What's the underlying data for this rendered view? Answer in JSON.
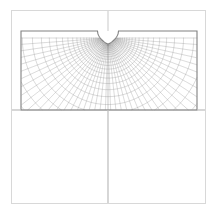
{
  "figure": {
    "title": "Polar finite-element mesh around a U-shaped edge notch",
    "caption": "",
    "background_color": "#ffffff",
    "width": 218,
    "height": 217
  },
  "outer_frame": {
    "name": "outer-frame",
    "x": 11,
    "y": 10,
    "width": 194,
    "height": 193,
    "stroke": "#d8d8d8",
    "stroke_width": 1,
    "fill": "none"
  },
  "crosshair": {
    "vertical_line": {
      "name": "vertical-centerline",
      "x": 108,
      "y1": 10,
      "y2": 203,
      "stroke": "#c9c9c9",
      "stroke_width": 1
    },
    "horizontal_line": {
      "name": "horizontal-centerline",
      "y": 110,
      "x1": 11,
      "x2": 205,
      "stroke": "#c9c9c9",
      "stroke_width": 1
    }
  },
  "plate": {
    "name": "plate-outline",
    "x": 21,
    "y": 31,
    "width": 176,
    "height": 79,
    "stroke": "#808080",
    "stroke_width": 1.1,
    "fill": "none"
  },
  "notch": {
    "name": "u-notch",
    "center_x": 108,
    "mouth_y": 31,
    "root_y": 44,
    "half_width": 10.5,
    "stroke": "#4a4a4a",
    "fill": "#ffffff",
    "shape": "u-shaped-edge-notch"
  },
  "mesh": {
    "name": "polar-mesh",
    "type": "conformal-polar",
    "origin_x": 108,
    "origin_y": 38,
    "radial_lines": 44,
    "circumferential_arcs": 26,
    "radius_min": 6,
    "radius_max": 120,
    "radial_growth": 1.135,
    "angle_start_deg": 0,
    "angle_end_deg": 180,
    "stroke": "#8c8c8c",
    "stroke_width": 0.34,
    "stroke_dense": "#6e6e6e",
    "stroke_width_dense": 0.3
  },
  "chart_data": {
    "type": "line",
    "title": "Polar finite-element mesh around a U-shaped edge notch",
    "xlabel": "",
    "ylabel": "",
    "xlim": [
      21,
      197
    ],
    "ylim": [
      31,
      110
    ],
    "grid": false,
    "legend": "none",
    "annotations": [],
    "series": [
      {
        "name": "radial-lines",
        "count": 44,
        "description": "Lines emanating from the notch root, fanning from 0 to 180 degrees and clipped at the plate boundary."
      },
      {
        "name": "circumferential-arcs",
        "count": 26,
        "description": "Nested arcs of geometrically growing radius, clipped at the plate boundary; dense near the notch root."
      },
      {
        "name": "plate-boundary",
        "count": 1,
        "description": "Rectangular plate outline 176 x 79 with a U-shaped notch at the top-centre."
      }
    ]
  }
}
